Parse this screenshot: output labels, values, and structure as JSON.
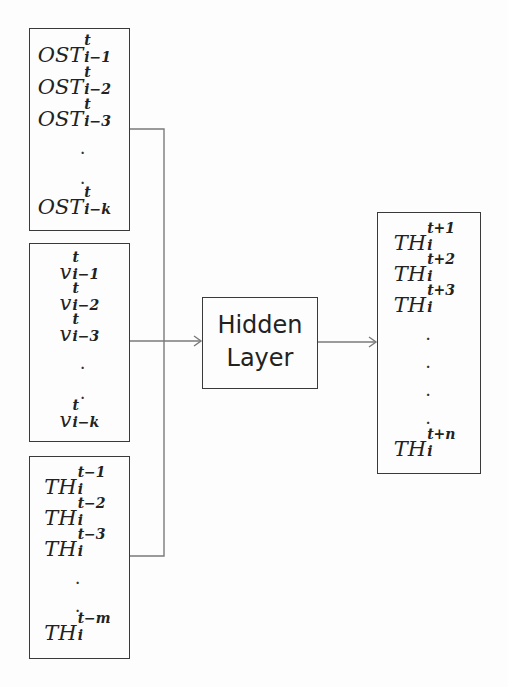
{
  "diagram": {
    "type": "neural-network-architecture",
    "input_groups": [
      {
        "id": "ost",
        "items": [
          {
            "base": "OST",
            "sup": "t",
            "sub": "i−1"
          },
          {
            "base": "OST",
            "sup": "t",
            "sub": "i−2"
          },
          {
            "base": "OST",
            "sup": "t",
            "sub": "i−3"
          },
          {
            "dot": "."
          },
          {
            "dot": "."
          },
          {
            "base": "OST",
            "sup": "t",
            "sub": "i−k"
          }
        ]
      },
      {
        "id": "v",
        "items": [
          {
            "base": "v",
            "sup": "t",
            "sub": "i−1"
          },
          {
            "base": "v",
            "sup": "t",
            "sub": "i−2"
          },
          {
            "base": "v",
            "sup": "t",
            "sub": "i−3"
          },
          {
            "dot": "."
          },
          {
            "dot": "."
          },
          {
            "base": "v",
            "sup": "t",
            "sub": "i−k"
          }
        ]
      },
      {
        "id": "th-past",
        "items": [
          {
            "base": "TH",
            "sup": "t−1",
            "sub": "i"
          },
          {
            "base": "TH",
            "sup": "t−2",
            "sub": "i"
          },
          {
            "base": "TH",
            "sup": "t−3",
            "sub": "i"
          },
          {
            "dot": "."
          },
          {
            "dot": "."
          },
          {
            "base": "TH",
            "sup": "t−m",
            "sub": "i"
          }
        ]
      }
    ],
    "hidden_layer": {
      "line1": "Hidden",
      "line2": "Layer"
    },
    "output_group": {
      "id": "th-future",
      "items": [
        {
          "base": "TH",
          "sup": "t+1",
          "sub": "i"
        },
        {
          "base": "TH",
          "sup": "t+2",
          "sub": "i"
        },
        {
          "base": "TH",
          "sup": "t+3",
          "sub": "i"
        },
        {
          "dot": "."
        },
        {
          "dot": "."
        },
        {
          "dot": "."
        },
        {
          "dot": "."
        },
        {
          "base": "TH",
          "sup": "t+n",
          "sub": "i"
        }
      ]
    },
    "colors": {
      "line": "#3a3a3a",
      "connector": "#777777",
      "background": "#fdfdfd",
      "text": "#222222"
    }
  }
}
